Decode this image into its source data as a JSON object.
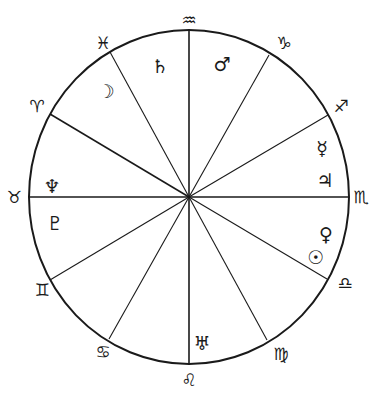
{
  "diagram": {
    "type": "astrological-house-chart",
    "center": {
      "x": 189,
      "y": 197
    },
    "radius": {
      "rx": 160,
      "ry": 167
    },
    "line_color": "#1a1a1a",
    "background": "#ffffff"
  },
  "spokes": [
    {
      "name": "aquarius",
      "x": 189,
      "y": 30
    },
    {
      "name": "capricorn",
      "x": 269,
      "y": 55
    },
    {
      "name": "sagittarius",
      "x": 328,
      "y": 115
    },
    {
      "name": "scorpio",
      "x": 349,
      "y": 197
    },
    {
      "name": "libra",
      "x": 327,
      "y": 279
    },
    {
      "name": "virgo",
      "x": 267,
      "y": 340
    },
    {
      "name": "leo",
      "x": 189,
      "y": 364
    },
    {
      "name": "cancer",
      "x": 109,
      "y": 339
    },
    {
      "name": "gemini",
      "x": 50,
      "y": 280
    },
    {
      "name": "taurus",
      "x": 29,
      "y": 197
    },
    {
      "name": "aries",
      "x": 50,
      "y": 114
    },
    {
      "name": "pisces",
      "x": 110,
      "y": 52
    }
  ],
  "signs": [
    {
      "name": "aquarius",
      "glyph": "♒",
      "x": 189,
      "y": 20
    },
    {
      "name": "capricorn",
      "glyph": "♑",
      "x": 284,
      "y": 43
    },
    {
      "name": "sagittarius",
      "glyph": "♐",
      "x": 341,
      "y": 106
    },
    {
      "name": "scorpio",
      "glyph": "♏",
      "x": 361,
      "y": 197
    },
    {
      "name": "libra",
      "glyph": "♎",
      "x": 345,
      "y": 283
    },
    {
      "name": "virgo",
      "glyph": "♍",
      "x": 281,
      "y": 354
    },
    {
      "name": "leo",
      "glyph": "♌",
      "x": 189,
      "y": 380
    },
    {
      "name": "cancer",
      "glyph": "♋",
      "x": 103,
      "y": 352
    },
    {
      "name": "gemini",
      "glyph": "♊",
      "x": 42,
      "y": 290
    },
    {
      "name": "taurus",
      "glyph": "♉",
      "x": 14,
      "y": 197
    },
    {
      "name": "aries",
      "glyph": "♈",
      "x": 37,
      "y": 106
    },
    {
      "name": "pisces",
      "glyph": "♓",
      "x": 103,
      "y": 43
    }
  ],
  "planets": [
    {
      "name": "saturn",
      "glyph": "♄",
      "x": 160,
      "y": 66
    },
    {
      "name": "mars",
      "glyph": "♂",
      "x": 222,
      "y": 64
    },
    {
      "name": "moon",
      "glyph": "☽",
      "x": 106,
      "y": 91
    },
    {
      "name": "mercury",
      "glyph": "☿",
      "x": 322,
      "y": 148
    },
    {
      "name": "jupiter",
      "glyph": "♃",
      "x": 325,
      "y": 180
    },
    {
      "name": "neptune",
      "glyph": "♆",
      "x": 52,
      "y": 186
    },
    {
      "name": "pluto",
      "glyph": "♇",
      "x": 55,
      "y": 223
    },
    {
      "name": "venus",
      "glyph": "♀",
      "x": 326,
      "y": 234
    },
    {
      "name": "sun",
      "glyph": "☉",
      "x": 316,
      "y": 257
    },
    {
      "name": "uranus",
      "glyph": "♅",
      "x": 202,
      "y": 343
    }
  ]
}
